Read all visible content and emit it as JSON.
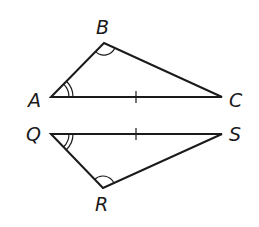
{
  "diagram": {
    "type": "congruent-triangles",
    "stroke_color": "#1a1a1a",
    "triangles": [
      {
        "name": "ABC",
        "vertices": {
          "A": {
            "label": "A",
            "x": 51,
            "y": 97,
            "label_x": 28,
            "label_y": 107
          },
          "B": {
            "label": "B",
            "x": 104,
            "y": 43,
            "label_x": 96,
            "label_y": 34
          },
          "C": {
            "label": "C",
            "x": 222,
            "y": 97,
            "label_x": 229,
            "label_y": 107
          }
        },
        "tick_side": "AC",
        "double_arc_vertex": "A",
        "single_arc_vertex": "B"
      },
      {
        "name": "QRS",
        "vertices": {
          "Q": {
            "label": "Q",
            "x": 51,
            "y": 134,
            "label_x": 26,
            "label_y": 141
          },
          "R": {
            "label": "R",
            "x": 103,
            "y": 188,
            "label_x": 95,
            "label_y": 211
          },
          "S": {
            "label": "S",
            "x": 222,
            "y": 134,
            "label_x": 229,
            "label_y": 141
          }
        },
        "tick_side": "QS",
        "double_arc_vertex": "Q",
        "single_arc_vertex": "R"
      }
    ],
    "labels": {
      "A": "A",
      "B": "B",
      "C": "C",
      "Q": "Q",
      "R": "R",
      "S": "S"
    }
  }
}
